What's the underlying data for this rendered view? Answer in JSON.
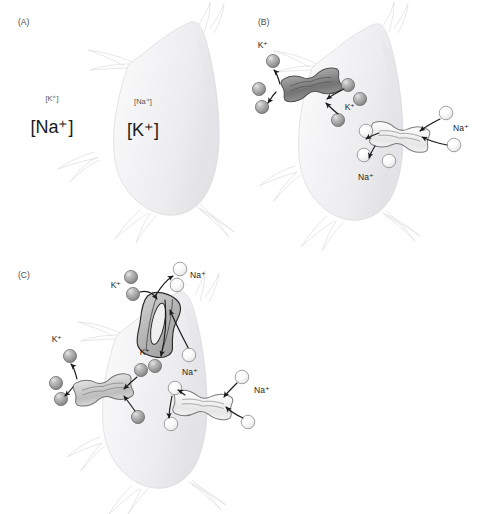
{
  "figure": {
    "background_color": "#ffffff",
    "width": 479,
    "height": 514,
    "faint_caption": "",
    "colors": {
      "cell_fill_light": "#f7f7f8",
      "cell_fill_mid": "#eeeef0",
      "cell_outline": "#d8d8da",
      "k_ion_fill": "#9d9d9d",
      "k_ion_outline": "#6e6e6e",
      "na_ion_fill": "#fdfdfd",
      "na_ion_outline": "#8c8c8c",
      "k_channel_dark": "#8a8a8a",
      "na_channel_light": "#f2f2f2",
      "pump_fill": "#bdbdbd",
      "arrow_stroke": "#1a1a1a",
      "text_color": "#231f20",
      "panel_label_color": "#4a4a4a"
    }
  },
  "panels": [
    {
      "id": "A",
      "label": "(A)",
      "description": "Resting cell showing ion concentration gradients across the membrane",
      "labels": [
        {
          "name": "extracellular-k-small",
          "text": "[K⁺]",
          "size": "small",
          "side": "outside"
        },
        {
          "name": "extracellular-na-big",
          "text": "[Na⁺]",
          "size": "large",
          "side": "outside"
        },
        {
          "name": "intracellular-na-small",
          "text": "[Na⁺]",
          "size": "small",
          "side": "inside"
        },
        {
          "name": "intracellular-k-big",
          "text": "[K⁺]",
          "size": "large",
          "side": "inside"
        }
      ]
    },
    {
      "id": "B",
      "label": "(B)",
      "description": "Leak channels: K+ channel on the left, Na+ channel on the right",
      "labels": [
        {
          "name": "k-outside-label",
          "text": "K⁺"
        },
        {
          "name": "k-inside-label",
          "text": "K⁺"
        },
        {
          "name": "na-outside-label",
          "text": "Na⁺"
        },
        {
          "name": "na-inside-label",
          "text": "Na⁺"
        }
      ],
      "channels": [
        {
          "name": "potassium-leak-channel",
          "ion": "K⁺",
          "shade": "dark"
        },
        {
          "name": "sodium-leak-channel",
          "ion": "Na⁺",
          "shade": "light"
        }
      ]
    },
    {
      "id": "C",
      "label": "(C)",
      "description": "Na+/K+ pump at top plus K+ and Na+ leak channels",
      "labels": [
        {
          "name": "pump-na-out-label",
          "text": "Na⁺"
        },
        {
          "name": "pump-k-in-label",
          "text": "K⁺"
        },
        {
          "name": "k-channel-outside-label",
          "text": "K⁺"
        },
        {
          "name": "k-cytosol-label",
          "text": "K⁺"
        },
        {
          "name": "na-cytosol-label",
          "text": "Na⁺"
        },
        {
          "name": "na-channel-outside-label",
          "text": "Na⁺"
        }
      ],
      "channels": [
        {
          "name": "sodium-potassium-pump",
          "ion": "Na⁺/K⁺",
          "shade": "dark-outline"
        },
        {
          "name": "potassium-leak-channel",
          "ion": "K⁺",
          "shade": "light"
        },
        {
          "name": "sodium-leak-channel",
          "ion": "Na⁺",
          "shade": "light"
        }
      ]
    }
  ]
}
